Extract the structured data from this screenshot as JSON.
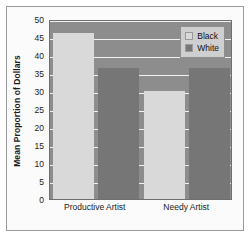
{
  "chart_data": {
    "type": "bar",
    "title": "",
    "xlabel": "",
    "ylabel": "Mean Proportion of Dollars",
    "categories": [
      "Productive Artist",
      "Needy Artist"
    ],
    "series": [
      {
        "name": "Black",
        "values": [
          46,
          30
        ],
        "color": "#d9d9d9"
      },
      {
        "name": "White",
        "values": [
          36.5,
          36.5
        ],
        "color": "#767676"
      }
    ],
    "ylim": [
      0,
      50
    ],
    "ytick_step": 5,
    "yticks": [
      0,
      5,
      10,
      15,
      20,
      25,
      30,
      35,
      40,
      45,
      50
    ],
    "ytick_labels": [
      "0",
      "5",
      "10",
      "15",
      "20",
      "25",
      "30",
      "35",
      "40",
      "45",
      "50"
    ],
    "grid": true,
    "grid_color": "#f2f2f2",
    "legend_position": "top-right",
    "plot_background": "#8d8d8d",
    "figure_background": "#fbfbfb"
  },
  "legend": {
    "entries": [
      {
        "label": "Black",
        "swatch": "black"
      },
      {
        "label": "White",
        "swatch": "white"
      }
    ]
  }
}
